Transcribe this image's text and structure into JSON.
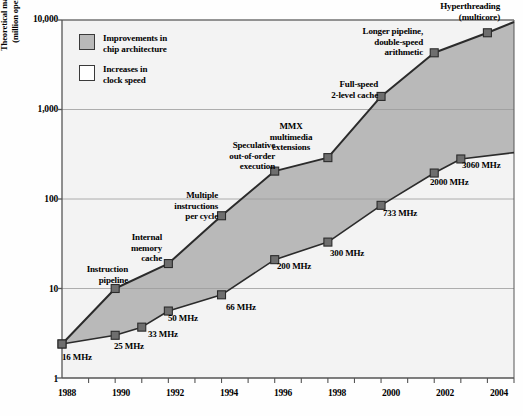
{
  "chart_data": {
    "type": "area",
    "title": "",
    "xlabel": "",
    "ylabel": "Theoretical maximum performance (million operations per second)",
    "ylabel_line1": "Theoretical maximum performance",
    "ylabel_line2": "(million operations per second)",
    "yscale": "log",
    "ylim": [
      1,
      10000
    ],
    "xlim": [
      1987,
      2004
    ],
    "ytick_labels": [
      "10,000",
      "1,000",
      "100",
      "10",
      "1"
    ],
    "ytick_values": [
      10000,
      1000,
      100,
      10,
      1
    ],
    "xtick_labels": [
      "1988",
      "1990",
      "1992",
      "1994",
      "1996",
      "1998",
      "2000",
      "2002",
      "2004"
    ],
    "xtick_values": [
      1988,
      1990,
      1992,
      1994,
      1996,
      1998,
      2000,
      2002,
      2004
    ],
    "grid": true,
    "legend": {
      "position": "upper-left-inside",
      "entries": [
        {
          "label_line1": "Improvements in",
          "label_line2": "chip architecture",
          "color": "#b9b9b9"
        },
        {
          "label_line1": "Increases in",
          "label_line2": "clock speed",
          "color": "#ffffff"
        }
      ]
    },
    "series": [
      {
        "name": "Theoretical maximum performance (architecture + clock)",
        "x": [
          1987,
          1989,
          1991,
          1993,
          1995,
          1997,
          1999,
          2001,
          2003,
          2004
        ],
        "values": [
          2.4,
          10,
          19,
          65,
          205,
          290,
          1400,
          4300,
          7200,
          9500
        ]
      },
      {
        "name": "Performance from clock speed increases alone",
        "x": [
          1987,
          1989,
          1990,
          1991,
          1993,
          1995,
          1997,
          1999,
          2001,
          2002,
          2004
        ],
        "values": [
          2.4,
          3.0,
          3.7,
          5.6,
          8.5,
          21,
          33,
          85,
          195,
          280,
          330
        ]
      }
    ],
    "clock_speed_labels": [
      {
        "text": "16 MHz",
        "year": 1987,
        "value": 2.4
      },
      {
        "text": "25 MHz",
        "year": 1989,
        "value": 3.0
      },
      {
        "text": "33 MHz",
        "year": 1990,
        "value": 3.7
      },
      {
        "text": "50 MHz",
        "year": 1991,
        "value": 5.6
      },
      {
        "text": "66 MHz",
        "year": 1993,
        "value": 8.5
      },
      {
        "text": "200 MHz",
        "year": 1995,
        "value": 21
      },
      {
        "text": "300 MHz",
        "year": 1997,
        "value": 33
      },
      {
        "text": "733 MHz",
        "year": 1999,
        "value": 85
      },
      {
        "text": "2000 MHz",
        "year": 2001,
        "value": 195
      },
      {
        "text": "3060 MHz",
        "year": 2002,
        "value": 280
      }
    ],
    "architecture_annotations": [
      {
        "line1": "Instruction",
        "line2": "pipeline",
        "line3": "",
        "year": 1989,
        "value": 10
      },
      {
        "line1": "Internal",
        "line2": "memory",
        "line3": "cache",
        "year": 1991,
        "value": 19
      },
      {
        "line1": "Multiple",
        "line2": "instructions",
        "line3": "per cycle",
        "year": 1993,
        "value": 65
      },
      {
        "line1": "Speculative",
        "line2": "out-of-order",
        "line3": "execution",
        "year": 1995,
        "value": 205
      },
      {
        "line1": "MMX",
        "line2": "multimedia",
        "line3": "extensions",
        "year": 1997,
        "value": 290
      },
      {
        "line1": "Full-speed",
        "line2": "2-level cache",
        "line3": "",
        "year": 1999,
        "value": 1400
      },
      {
        "line1": "Longer pipeline,",
        "line2": "double-speed",
        "line3": "arithmetic",
        "year": 2001,
        "value": 4300
      },
      {
        "line1": "Hyperthreading",
        "line2": "(multicore)",
        "line3": "",
        "year": 2003,
        "value": 7200
      }
    ],
    "colors": {
      "fill": "#b9b9b9",
      "line": "#2b2b2b",
      "marker": "#6e6e6e",
      "grid": "#9a9a9a",
      "axis": "#555555",
      "plot_background": "#f3f3f3"
    }
  }
}
